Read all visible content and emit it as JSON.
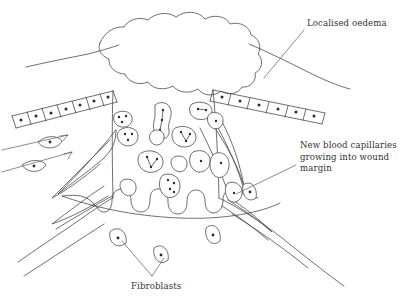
{
  "figure": {
    "background_color": "#ffffff",
    "ink_color": "#4a4a4a",
    "nucleus_color": "#2b2b2b"
  },
  "labels": {
    "oedema": {
      "text": "Localised oedema",
      "lines": [
        "Localised oedema"
      ]
    },
    "capillaries": {
      "text": "New blood capillaries\ngrowing into wound\nmargin",
      "lines": [
        "New blood capillaries",
        "growing into wound",
        "margin"
      ]
    },
    "fibroblasts": {
      "text": "Fibroblasts",
      "lines": [
        "Fibroblasts"
      ]
    }
  },
  "structures": {
    "oedema_blob": "cloud-shaped localised oedema swelling at wound surface",
    "epidermis_left": "band of rectangular epidermal cells sloping up to the right",
    "epidermis_right": "band of rectangular epidermal cells sloping down to the right",
    "skin_surface_left": "curved skin surface line on the left",
    "skin_surface_right": "curved skin surface line on the right",
    "wound_cavity": "central wound cavity containing inflammatory cells",
    "granulation_base": "scalloped capillary loops forming wound base",
    "capillary_sprouts_left": "elongated tapering capillary sprouts entering from the left",
    "capillary_sprouts_right": "elongated tapering capillary sprouts entering from the right",
    "dermis_left": "dermal tissue boundary sweeping down to the left",
    "dermis_right": "dermal tissue boundary sweeping down to the right"
  },
  "cell_counts": {
    "epidermal_cells_left": 7,
    "epidermal_cells_right": 6,
    "inflammatory_cells": 14,
    "fibroblasts": 7
  }
}
